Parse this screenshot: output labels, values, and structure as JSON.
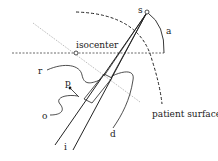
{
  "diagram": {
    "labels": {
      "source": "s",
      "angle": "a",
      "isocenter": "isocenter",
      "ray": "r",
      "point": "p",
      "offset": "o",
      "incident": "i",
      "depth": "d",
      "patient_surface": "patient surface"
    },
    "colors": {
      "line": "#222222",
      "dotted_line": "#888888",
      "background": "#ffffff"
    }
  }
}
